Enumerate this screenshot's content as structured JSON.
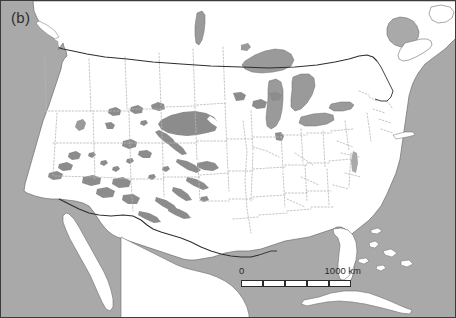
{
  "figure": {
    "panel_label": "(b)",
    "type": "map",
    "region": "North America / contiguous United States",
    "projection_note": "conic",
    "frame_color": "#3b3b3b"
  },
  "colors": {
    "ocean": "#a9a9a9",
    "land": "#ffffff",
    "shaded_region": "#8c8c8c",
    "lake": "#9a9a9a",
    "state_border": "#b5b5b5",
    "national_border": "#2e2e2e",
    "coastline": "#6e6e6e",
    "text": "#2b2b2b"
  },
  "scalebar": {
    "zero_label": "0",
    "max_label": "1000 km",
    "segments": 5,
    "unit": "km",
    "total": 1000
  },
  "legend_items": [
    {
      "name": "shaded-area",
      "label": ""
    }
  ],
  "map_features": {
    "oceans": [
      "Pacific Ocean",
      "Atlantic Ocean",
      "Gulf of Mexico"
    ],
    "lakes": [
      "Lake Superior",
      "Lake Michigan",
      "Lake Huron",
      "Lake Erie",
      "Lake Ontario",
      "Great Salt Lake",
      "Lake Winnipeg"
    ],
    "landmasses": [
      "United States",
      "Canada",
      "Mexico",
      "Baja California",
      "Cuba",
      "Bahamas",
      "Nova Scotia",
      "Florida",
      "Long Island"
    ],
    "borders": [
      "US-Canada 49th parallel",
      "US-Mexico Rio Grande",
      "US state boundaries"
    ]
  },
  "chart_data": {
    "type": "map",
    "title": "(b)",
    "shaded_regions_count": 28,
    "shaded_region_description": "dark grey patches concentrated in the Great Plains (Nebraska Sand Hills) and the desert Southwest"
  }
}
